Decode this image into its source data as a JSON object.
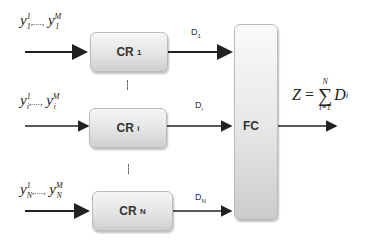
{
  "diagram": {
    "type": "block-diagram",
    "inputs": [
      {
        "label_first": "y",
        "sup_first": "1",
        "sub": "1",
        "sep": ",....,",
        "label_last": "y",
        "sup_last": "M"
      },
      {
        "label_first": "y",
        "sup_first": "1",
        "sub": "i",
        "sep": ",....,",
        "label_last": "y",
        "sup_last": "M"
      },
      {
        "label_first": "y",
        "sup_first": "1",
        "sub": "N",
        "sep": ",....,",
        "label_last": "y",
        "sup_last": "M"
      }
    ],
    "blocks": [
      {
        "name": "CR",
        "sub": "1"
      },
      {
        "name": "CR",
        "sub": "i"
      },
      {
        "name": "CR",
        "sub": "N"
      }
    ],
    "decisions": [
      {
        "name": "D",
        "sub": "1"
      },
      {
        "name": "D",
        "sub": "i"
      },
      {
        "name": "D",
        "sub": "N"
      }
    ],
    "fusion_center": {
      "label": "FC"
    },
    "output": {
      "lhs": "Z",
      "equals": "=",
      "sum_symbol": "∑",
      "upper_limit": "N",
      "lower_limit": "i=1",
      "term": "D",
      "term_sub": "i"
    }
  }
}
